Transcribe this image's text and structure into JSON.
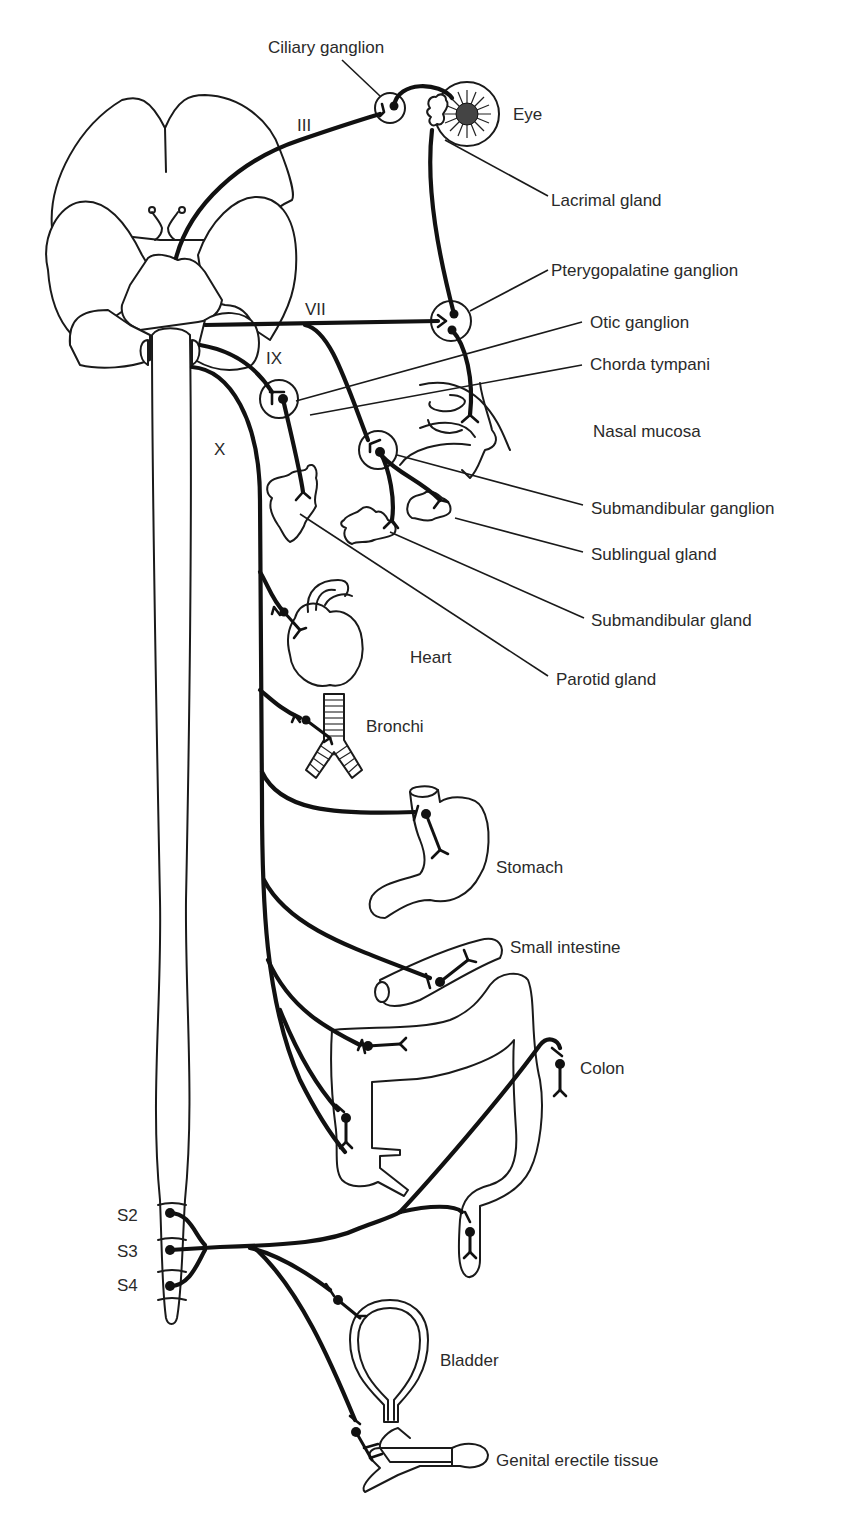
{
  "figure": {
    "cranial_nerves": [
      {
        "id": "III",
        "label": "III"
      },
      {
        "id": "VII",
        "label": "VII"
      },
      {
        "id": "IX",
        "label": "IX"
      },
      {
        "id": "X",
        "label": "X"
      }
    ],
    "sacral_segments": [
      {
        "id": "S2",
        "label": "S2"
      },
      {
        "id": "S3",
        "label": "S3"
      },
      {
        "id": "S4",
        "label": "S4"
      }
    ],
    "labels": {
      "ciliary_ganglion": "Ciliary ganglion",
      "eye": "Eye",
      "lacrimal_gland": "Lacrimal gland",
      "pterygopalatine_ganglion": "Pterygopalatine ganglion",
      "otic_ganglion": "Otic ganglion",
      "chorda_tympani": "Chorda tympani",
      "nasal_mucosa": "Nasal mucosa",
      "submandibular_ganglion": "Submandibular ganglion",
      "sublingual_gland": "Sublingual gland",
      "submandibular_gland": "Submandibular gland",
      "parotid_gland": "Parotid gland",
      "heart": "Heart",
      "bronchi": "Bronchi",
      "stomach": "Stomach",
      "small_intestine": "Small intestine",
      "colon": "Colon",
      "bladder": "Bladder",
      "genital_erectile_tissue": "Genital erectile tissue"
    }
  }
}
